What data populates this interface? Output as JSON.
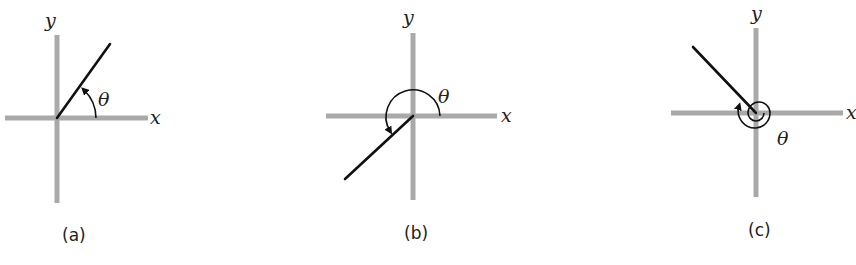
{
  "figure": {
    "panels": [
      {
        "caption": "(a)",
        "x_label": "x",
        "y_label": "y",
        "angle_label": "θ",
        "angle_description": "acute angle in first quadrant"
      },
      {
        "caption": "(b)",
        "x_label": "x",
        "y_label": "y",
        "angle_label": "θ",
        "angle_description": "angle greater than 180°, terminal side in third quadrant"
      },
      {
        "caption": "(c)",
        "x_label": "x",
        "y_label": "y",
        "angle_label": "θ",
        "angle_description": "angle greater than 360°, terminal side in second quadrant"
      }
    ]
  },
  "colors": {
    "axis": "#a9a9a9",
    "ray": "#111111"
  }
}
